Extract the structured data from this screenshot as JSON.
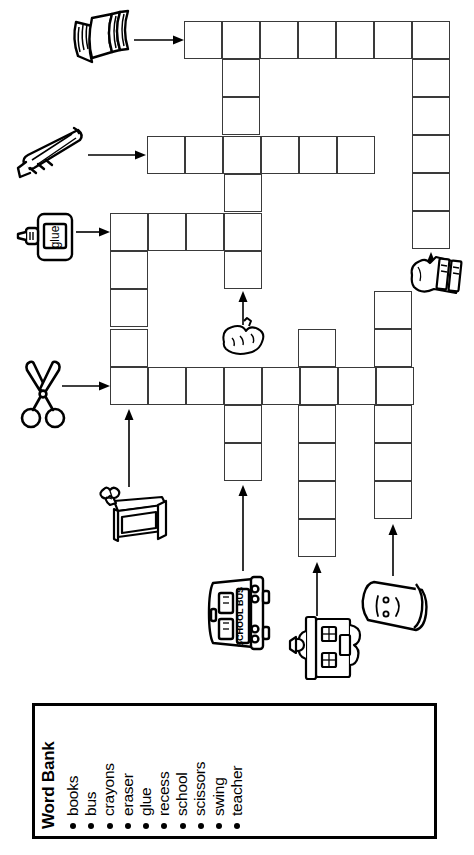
{
  "page": {
    "orientation": "rotated-90",
    "ink_color": "#000000",
    "grid_line_color": "#3a3a3a",
    "background": "#ffffff"
  },
  "word_bank": {
    "title": "Word Bank",
    "words": [
      "books",
      "bus",
      "crayons",
      "eraser",
      "glue",
      "recess",
      "school",
      "scissors",
      "swing",
      "teacher"
    ]
  },
  "clues": [
    {
      "id": "books",
      "icon": "books-stack-icon",
      "answer": "books",
      "direction": "across",
      "length": 7,
      "arrow": "right"
    },
    {
      "id": "crayons",
      "icon": "crayons-icon",
      "answer": "crayons",
      "direction": "across",
      "length": 6,
      "arrow": "right"
    },
    {
      "id": "glue",
      "icon": "glue-bottle-icon",
      "answer": "glue",
      "direction": "across",
      "length": 4,
      "arrow": "right"
    },
    {
      "id": "scissors",
      "icon": "scissors-icon",
      "answer": "scissors",
      "direction": "across",
      "length": 8,
      "arrow": "right"
    },
    {
      "id": "eraser",
      "icon": "eraser-icon",
      "answer": "eraser",
      "direction": "down",
      "length": 6,
      "arrow": "up"
    },
    {
      "id": "teacher",
      "icon": "teacher-desk-icon",
      "answer": "teacher",
      "direction": "down",
      "length": 7,
      "arrow": "up"
    },
    {
      "id": "bus",
      "icon": "school-bus-icon",
      "answer": "bus",
      "direction": "down",
      "length": 3,
      "arrow": "up"
    },
    {
      "id": "school",
      "icon": "school-building-icon",
      "answer": "school",
      "direction": "down",
      "length": 6,
      "arrow": "up"
    },
    {
      "id": "swing",
      "icon": "swing-icon",
      "answer": "swing",
      "direction": "down",
      "length": 6,
      "arrow": "up"
    },
    {
      "id": "recess",
      "icon": "recess-books-icon",
      "answer": "recess",
      "direction": "down",
      "length": 5,
      "arrow": "up"
    }
  ],
  "grid": {
    "cell_size": 38,
    "entries": [
      {
        "name": "books-across",
        "x": 184,
        "y": 21,
        "dir": "across",
        "len": 7
      },
      {
        "name": "crayons-across",
        "x": 147,
        "y": 136,
        "dir": "across",
        "len": 6
      },
      {
        "name": "glue-across",
        "x": 110,
        "y": 213,
        "dir": "across",
        "len": 4
      },
      {
        "name": "scissors-across",
        "x": 110,
        "y": 367,
        "dir": "across",
        "len": 8
      },
      {
        "name": "recess-down",
        "x": 412,
        "y": 21,
        "dir": "down",
        "len": 5
      },
      {
        "name": "eraser-down",
        "x": 222,
        "y": 21,
        "dir": "down",
        "len": 7
      },
      {
        "name": "teacher-down",
        "x": 110,
        "y": 213,
        "dir": "down",
        "len": 5
      },
      {
        "name": "bus-down",
        "x": 222,
        "y": 367,
        "dir": "down",
        "len": 3
      },
      {
        "name": "school-down",
        "x": 298,
        "y": 329,
        "dir": "down",
        "len": 6
      },
      {
        "name": "swing-down",
        "x": 374,
        "y": 291,
        "dir": "down",
        "len": 6
      }
    ]
  }
}
